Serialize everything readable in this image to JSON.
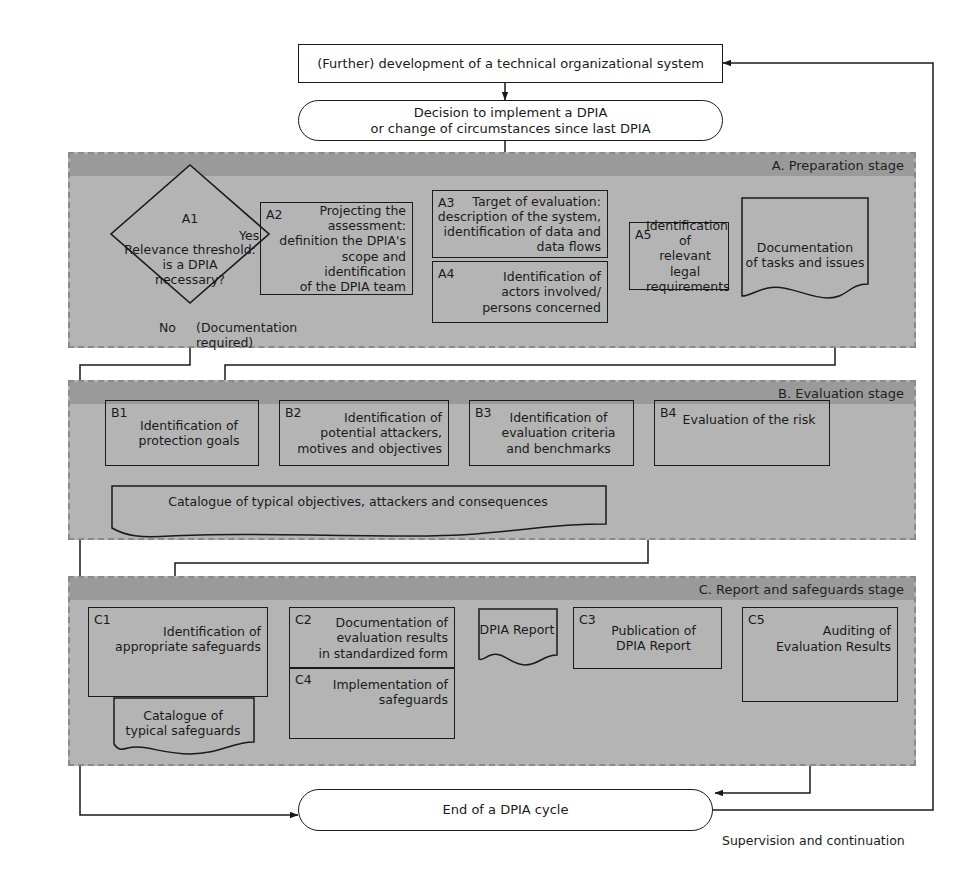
{
  "diagram": {
    "colors": {
      "stage_header": "#9a9a9a",
      "stage_body": "#b4b4b4",
      "stroke": "#1a1a1a",
      "stage_border": "#8a8a8a",
      "white": "#ffffff"
    }
  },
  "top": {
    "development_box": "(Further) development of a technical organizational system",
    "decision_pill": "Decision to implement a DPIA\nor change of circumstances since last DPIA"
  },
  "stage_a": {
    "header": "A. Preparation stage",
    "a1": {
      "tag": "A1",
      "text": "Relevance threshold:\nis a DPIA\nnecessary?"
    },
    "a2": {
      "tag": "A2",
      "text": "Projecting the\nassessment:\ndefinition the DPIA's\nscope and identification\nof the DPIA team"
    },
    "a3": {
      "tag": "A3",
      "text": "Target of evaluation:\ndescription of the system,\nidentification of data and\ndata flows"
    },
    "a4": {
      "tag": "A4",
      "text": "Identification of\nactors involved/\npersons concerned"
    },
    "a5": {
      "tag": "A5",
      "text": "Identification of\nrelevant legal\nrequirements"
    },
    "documentation_doc": "Documentation\nof tasks and issues",
    "label_yes": "Yes",
    "label_no": "No",
    "label_documentation_required": "(Documentation\nrequired)"
  },
  "stage_b": {
    "header": "B. Evaluation stage",
    "b1": {
      "tag": "B1",
      "text": "Identification of\nprotection goals"
    },
    "b2": {
      "tag": "B2",
      "text": "Identification of\npotential attackers,\nmotives and objectives"
    },
    "b3": {
      "tag": "B3",
      "text": "Identification of\nevaluation criteria\nand benchmarks"
    },
    "b4": {
      "tag": "B4",
      "text": "Evaluation of the risk"
    },
    "catalogue_doc": "Catalogue of typical objectives, attackers and consequences"
  },
  "stage_c": {
    "header": "C. Report and safeguards stage",
    "c1": {
      "tag": "C1",
      "text": "Identification of\nappropriate safeguards"
    },
    "c2": {
      "tag": "C2",
      "text": "Documentation of\nevaluation results\nin standardized form"
    },
    "c3": {
      "tag": "C3",
      "text": "Publication of\nDPIA Report"
    },
    "c4": {
      "tag": "C4",
      "text": "Implementation of\nsafeguards"
    },
    "c5": {
      "tag": "C5",
      "text": "Auditing of\nEvaluation Results"
    },
    "dpia_report_doc": "DPIA Report",
    "catalogue_doc": "Catalogue of\ntypical safeguards"
  },
  "bottom": {
    "end_pill": "End of a DPIA cycle",
    "supervision_label": "Supervision and continuation"
  }
}
